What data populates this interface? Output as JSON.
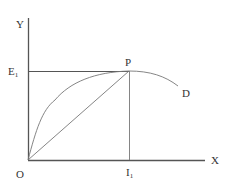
{
  "diagram": {
    "axes": {
      "y_label": "Y",
      "x_label": "X",
      "origin_label": "O"
    },
    "points": {
      "p_label": "P",
      "e_label": "E",
      "e_sub": "1",
      "i_label": "I",
      "i_sub": "1"
    },
    "curve_label": "D",
    "colors": {
      "axis": "#555555",
      "line": "#777777",
      "text": "#333333"
    }
  }
}
